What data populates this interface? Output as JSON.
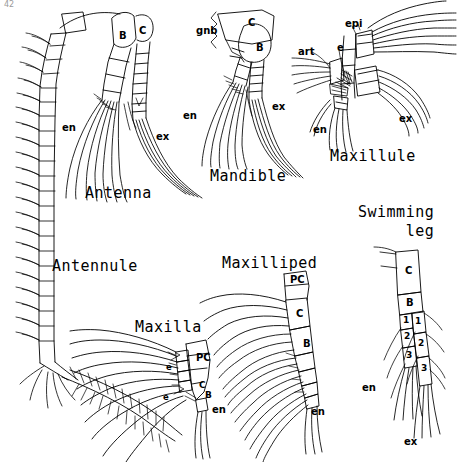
{
  "plate": {
    "corner_mark": "42",
    "background": "#ffffff",
    "ink": "#000000",
    "width": 458,
    "height": 462
  },
  "figures": [
    {
      "id": "antennule",
      "caption": "Antennule",
      "caption_pos": [
        52,
        257
      ],
      "labels": []
    },
    {
      "id": "antenna",
      "caption": "Antenna",
      "caption_pos": [
        85,
        184
      ],
      "labels": [
        {
          "text": "B",
          "pos": [
            119,
            30
          ]
        },
        {
          "text": "C",
          "pos": [
            139,
            25
          ]
        },
        {
          "text": "en",
          "pos": [
            62,
            122
          ]
        },
        {
          "text": "ex",
          "pos": [
            156,
            131
          ]
        }
      ]
    },
    {
      "id": "mandible",
      "caption": "Mandible",
      "caption_pos": [
        210,
        167
      ],
      "labels": [
        {
          "text": "gnb",
          "pos": [
            196,
            25
          ]
        },
        {
          "text": "C",
          "pos": [
            248,
            17
          ]
        },
        {
          "text": "B",
          "pos": [
            256,
            42
          ]
        },
        {
          "text": "en",
          "pos": [
            183,
            110
          ]
        },
        {
          "text": "ex",
          "pos": [
            272,
            101
          ]
        }
      ]
    },
    {
      "id": "maxillule",
      "caption": "Maxillule",
      "caption_pos": [
        330,
        147
      ],
      "labels": [
        {
          "text": "art",
          "pos": [
            298,
            46
          ]
        },
        {
          "text": "e",
          "pos": [
            337,
            42
          ]
        },
        {
          "text": "epi",
          "pos": [
            345,
            18
          ]
        },
        {
          "text": "en",
          "pos": [
            313,
            124
          ]
        },
        {
          "text": "ex",
          "pos": [
            399,
            113
          ]
        }
      ]
    },
    {
      "id": "maxilla",
      "caption": "Maxilla",
      "caption_pos": [
        135,
        318
      ],
      "labels": [
        {
          "text": "PC",
          "pos": [
            196,
            352
          ]
        },
        {
          "text": "C",
          "pos": [
            199,
            380
          ]
        },
        {
          "text": "B",
          "pos": [
            205,
            390
          ]
        },
        {
          "text": "e",
          "pos": [
            175,
            363
          ]
        },
        {
          "text": "e",
          "pos": [
            168,
            393
          ]
        },
        {
          "text": "en",
          "pos": [
            212,
            404
          ]
        }
      ]
    },
    {
      "id": "maxilliped",
      "caption": "Maxilliped",
      "caption_pos": [
        222,
        254
      ],
      "labels": [
        {
          "text": "PC",
          "pos": [
            290,
            280
          ]
        },
        {
          "text": "C",
          "pos": [
            296,
            310
          ]
        },
        {
          "text": "B",
          "pos": [
            303,
            340
          ]
        },
        {
          "text": "en",
          "pos": [
            311,
            409
          ]
        }
      ]
    },
    {
      "id": "swimming-leg",
      "caption": "Swimming\n     leg",
      "caption_pos": [
        358,
        203
      ],
      "labels": [
        {
          "text": "C",
          "pos": [
            407,
            268
          ]
        },
        {
          "text": "B",
          "pos": [
            389,
            301
          ]
        },
        {
          "text": "1",
          "pos": [
            382,
            320
          ]
        },
        {
          "text": "2",
          "pos": [
            385,
            338
          ]
        },
        {
          "text": "3",
          "pos": [
            389,
            357
          ]
        },
        {
          "text": "1",
          "pos": [
            404,
            322
          ]
        },
        {
          "text": "2",
          "pos": [
            410,
            344
          ]
        },
        {
          "text": "3",
          "pos": [
            416,
            370
          ]
        },
        {
          "text": "en",
          "pos": [
            362,
            382
          ]
        },
        {
          "text": "ex",
          "pos": [
            404,
            436
          ]
        }
      ]
    }
  ]
}
